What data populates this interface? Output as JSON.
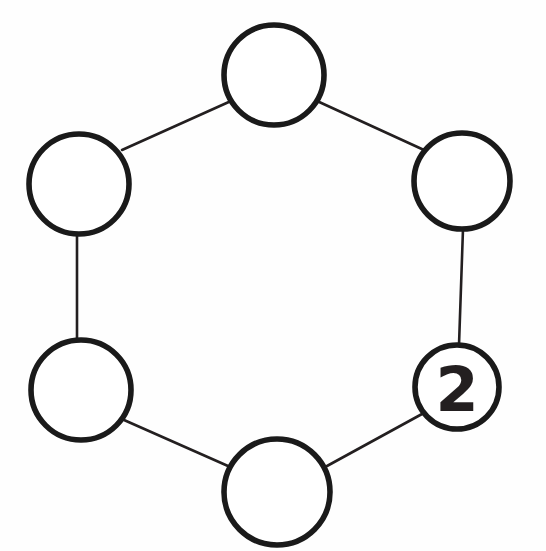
{
  "diagram": {
    "type": "cycle-graph",
    "title": "",
    "background_color": "#fefefe",
    "node_fill_color": "#ffffff",
    "node_stroke_color": "#1a1a1a",
    "edge_color": "#231f20",
    "label_color": "#231f20",
    "node_count": 6,
    "edge_count": 6,
    "nodes": [
      {
        "id": "node-top",
        "label": "",
        "cx": 274,
        "cy": 75,
        "r": 50,
        "stroke_width": 5.8,
        "position_name": "top"
      },
      {
        "id": "node-upper-right",
        "label": "",
        "cx": 462,
        "cy": 181,
        "r": 48,
        "stroke_width": 5.6,
        "position_name": "upper-right"
      },
      {
        "id": "node-lower-right",
        "label": "2",
        "cx": 457,
        "cy": 387,
        "r": 42,
        "stroke_width": 5.4,
        "position_name": "lower-right"
      },
      {
        "id": "node-bottom",
        "label": "",
        "cx": 277,
        "cy": 492,
        "r": 53,
        "stroke_width": 5.8,
        "position_name": "bottom"
      },
      {
        "id": "node-lower-left",
        "label": "",
        "cx": 81,
        "cy": 390,
        "r": 50,
        "stroke_width": 5.8,
        "position_name": "lower-left"
      },
      {
        "id": "node-upper-left",
        "label": "",
        "cx": 79,
        "cy": 184,
        "r": 50,
        "stroke_width": 5.8,
        "position_name": "upper-left"
      }
    ],
    "edges": [
      {
        "id": "edge-top-upper-right",
        "from": "node-top",
        "to": "node-upper-right",
        "x1": 317,
        "y1": 101,
        "x2": 424,
        "y2": 150
      },
      {
        "id": "edge-upper-right-lower-right",
        "from": "node-upper-right",
        "to": "node-lower-right",
        "x1": 463,
        "y1": 229,
        "x2": 459,
        "y2": 345
      },
      {
        "id": "edge-lower-right-bottom",
        "from": "node-lower-right",
        "to": "node-bottom",
        "x1": 422,
        "y1": 414,
        "x2": 327,
        "y2": 466
      },
      {
        "id": "edge-bottom-lower-left",
        "from": "node-bottom",
        "to": "node-lower-left",
        "x1": 228,
        "y1": 466,
        "x2": 124,
        "y2": 420
      },
      {
        "id": "edge-lower-left-upper-left",
        "from": "node-lower-left",
        "to": "node-upper-left",
        "x1": 77,
        "y1": 340,
        "x2": 77,
        "y2": 234
      },
      {
        "id": "edge-upper-left-top",
        "from": "node-upper-left",
        "to": "node-top",
        "x1": 122,
        "y1": 150,
        "x2": 231,
        "y2": 101
      }
    ]
  }
}
